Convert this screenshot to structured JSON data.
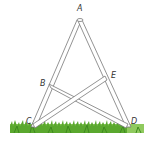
{
  "diagram": {
    "type": "geometry-figure",
    "points": [
      {
        "label": "A",
        "x": 79,
        "y": 20
      },
      {
        "label": "B",
        "x": 50,
        "y": 86
      },
      {
        "label": "C",
        "x": 33,
        "y": 127
      },
      {
        "label": "D",
        "x": 128,
        "y": 127
      },
      {
        "label": "E",
        "x": 106,
        "y": 78
      }
    ],
    "segments": [
      [
        "A",
        "C"
      ],
      [
        "A",
        "D"
      ],
      [
        "B",
        "D"
      ],
      [
        "E",
        "C"
      ]
    ],
    "labels": {
      "A": "A",
      "B": "B",
      "C": "C",
      "D": "D",
      "E": "E"
    },
    "colors": {
      "beam_stroke": "#777777",
      "beam_fill": "#ffffff",
      "grass_dark": "#5aa82e",
      "grass_light": "#9ad16a",
      "label": "#333333"
    }
  }
}
